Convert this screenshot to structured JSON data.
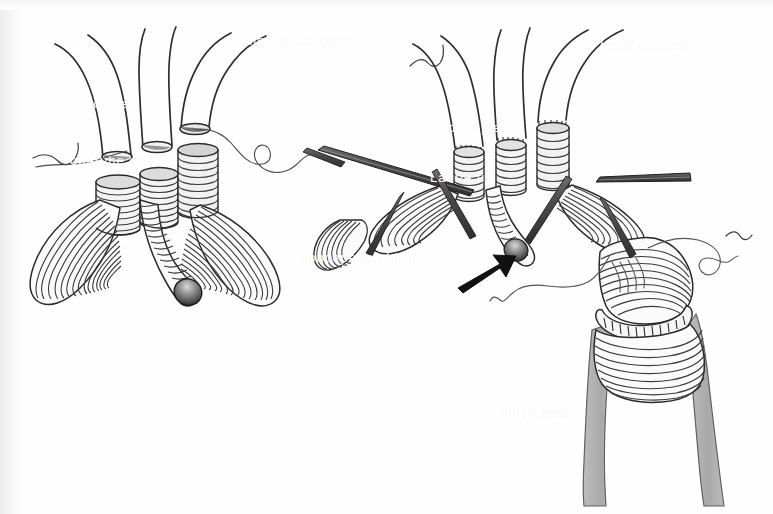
{
  "document": {
    "type": "scanned-surgical-illustration",
    "title": "Aortic arch branch graft anastomosis",
    "background_color": "#fefefe",
    "ink_color": "#2b2b2b",
    "shade_color": "#a8a8a8",
    "width": 773,
    "height": 514
  },
  "panels": [
    {
      "id": "left-panel",
      "name": "Left illustration — trifurcated graft, unclamped",
      "label": "",
      "center_x": 170,
      "center_y": 200,
      "branch_count": 3,
      "has_arrow": false,
      "has_instruments": false,
      "has_shaded_vessel": false
    },
    {
      "id": "right-panel",
      "name": "Right illustration — trifurcated graft with instruments and distal anastomosis",
      "label": "",
      "center_x": 545,
      "center_y": 215,
      "branch_count": 3,
      "has_arrow": true,
      "has_instruments": true,
      "has_shaded_vessel": true
    }
  ],
  "annotations": {
    "arrow": {
      "name": "direction-arrow",
      "color": "#1a1a1a",
      "tip_x": 512,
      "tip_y": 258,
      "tail_x": 462,
      "tail_y": 285
    },
    "bead": {
      "name": "occluding-bead",
      "color_light": "#c9c9c9",
      "color_dark": "#3a3a3a"
    }
  },
  "instruments": [
    {
      "name": "retractor-bar-left",
      "x1": 318,
      "y1": 153,
      "x2": 470,
      "y2": 196
    },
    {
      "name": "retractor-bar-right",
      "x1": 595,
      "y1": 186,
      "x2": 690,
      "y2": 178
    },
    {
      "name": "needle-bar-top-left",
      "x1": 303,
      "y1": 150,
      "x2": 340,
      "y2": 164
    }
  ],
  "sutures": [
    {
      "name": "suture-thread-left",
      "note": "wavy thread from left graft top extending right"
    },
    {
      "name": "suture-thread-right",
      "note": "wavy thread trailing right from distal anastomosis"
    },
    {
      "name": "suture-thread-center",
      "note": "thread curving below right graft body"
    }
  ],
  "ghost_text": [
    {
      "text": "nigdhy obsipqodi",
      "x": 245,
      "y": 33
    },
    {
      "text": "Leah e noveh",
      "x": 600,
      "y": 38
    },
    {
      "text": "ieno otypen",
      "x": 60,
      "y": 96
    },
    {
      "text": "mondem pie",
      "x": 420,
      "y": 120
    },
    {
      "text": "oberuhe ef",
      "x": 70,
      "y": 153
    },
    {
      "text": "Laurie fit",
      "x": 430,
      "y": 170
    },
    {
      "text": "honcepeagn hirtif",
      "x": 300,
      "y": 250
    },
    {
      "text": "onlyh pedi",
      "x": 500,
      "y": 405
    }
  ]
}
